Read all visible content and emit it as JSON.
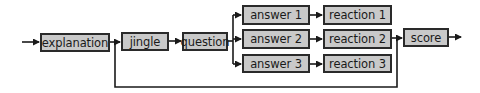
{
  "diagram": {
    "type": "flowchart",
    "colors": {
      "node_fill": "#c9c9c9",
      "node_border": "#2a2a2a",
      "wire": "#1a1a1a",
      "background": "#ffffff"
    },
    "nodes": {
      "explanation": {
        "label": "explanation",
        "x": 40,
        "y": 33,
        "w": 70,
        "h": 19
      },
      "jingle": {
        "label": "jingle",
        "x": 121,
        "y": 32,
        "w": 48,
        "h": 19
      },
      "question": {
        "label": "question",
        "x": 182,
        "y": 32,
        "w": 46,
        "h": 19
      },
      "answer1": {
        "label": "answer 1",
        "x": 242,
        "y": 5,
        "w": 68,
        "h": 20
      },
      "answer2": {
        "label": "answer 2",
        "x": 242,
        "y": 29,
        "w": 68,
        "h": 20
      },
      "answer3": {
        "label": "answer 3",
        "x": 242,
        "y": 54,
        "w": 68,
        "h": 19
      },
      "reaction1": {
        "label": "reaction 1",
        "x": 323,
        "y": 5,
        "w": 69,
        "h": 20
      },
      "reaction2": {
        "label": "reaction 2",
        "x": 323,
        "y": 29,
        "w": 69,
        "h": 20
      },
      "reaction3": {
        "label": "reaction 3",
        "x": 323,
        "y": 54,
        "w": 69,
        "h": 19
      },
      "score": {
        "label": "score",
        "x": 403,
        "y": 28,
        "w": 46,
        "h": 19
      }
    },
    "edges": [
      {
        "from": "input",
        "to": "explanation"
      },
      {
        "from": "explanation",
        "to": "jingle"
      },
      {
        "from": "jingle",
        "to": "question"
      },
      {
        "from": "question",
        "to": "answer1"
      },
      {
        "from": "question",
        "to": "answer2"
      },
      {
        "from": "question",
        "to": "answer3"
      },
      {
        "from": "answer1",
        "to": "reaction1"
      },
      {
        "from": "answer2",
        "to": "reaction2"
      },
      {
        "from": "answer3",
        "to": "reaction3"
      },
      {
        "from": "reaction2",
        "to": "score"
      },
      {
        "from": "explanation",
        "to": "score",
        "note": "bypass loop along bottom"
      },
      {
        "from": "score",
        "to": "output"
      }
    ]
  }
}
